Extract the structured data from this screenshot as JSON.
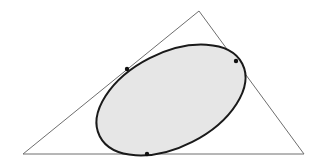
{
  "diagram": {
    "colors": {
      "background": "#ffffff",
      "triangle_stroke": "#6e6e6e",
      "ellipse_fill": "#e6e6e6",
      "ellipse_stroke": "#1a1a1a",
      "point_fill": "#111111"
    },
    "triangle": {
      "vertices": [
        [
          23,
          154
        ],
        [
          199,
          11
        ],
        [
          304,
          154
        ]
      ]
    },
    "ellipse": {
      "cx": 171,
      "cy": 100,
      "rx": 80,
      "ry": 47,
      "rotation_deg": -27
    },
    "tangent_points": [
      {
        "name": "left-side",
        "x": 127,
        "y": 69
      },
      {
        "name": "right-side",
        "x": 236,
        "y": 61
      },
      {
        "name": "base",
        "x": 147,
        "y": 154
      }
    ]
  }
}
